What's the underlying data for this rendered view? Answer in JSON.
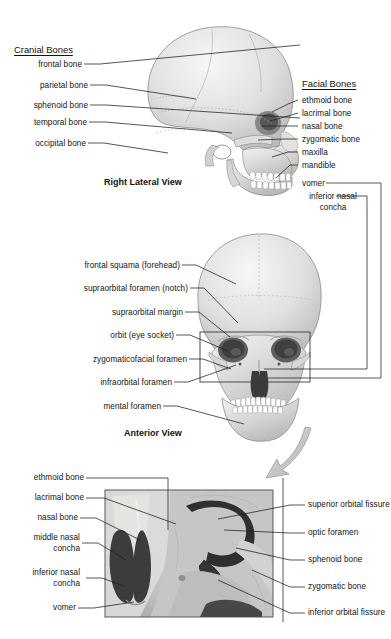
{
  "figure": {
    "background_color": "#ffffff",
    "line_color": "#1a1a1a",
    "panels": [
      {
        "name": "lateral",
        "caption": "Right Lateral View"
      },
      {
        "name": "anterior",
        "caption": "Anterior View"
      },
      {
        "name": "orbit-detail",
        "caption": ""
      }
    ]
  },
  "lateral_panel": {
    "caption": "Right Lateral View",
    "left_heading": "Cranial Bones",
    "right_heading": "Facial Bones",
    "cranial_bones": [
      {
        "label": "frontal bone"
      },
      {
        "label": "parietal bone"
      },
      {
        "label": "sphenoid bone"
      },
      {
        "label": "temporal bone"
      },
      {
        "label": "occipital bone"
      }
    ],
    "facial_bones": [
      {
        "label": "ethmoid bone"
      },
      {
        "label": "lacrimal bone"
      },
      {
        "label": "nasal bone"
      },
      {
        "label": "zygomatic bone"
      },
      {
        "label": "maxilla"
      },
      {
        "label": "mandible"
      },
      {
        "label": "vomer"
      },
      {
        "label": "inferior nasal concha"
      }
    ]
  },
  "anterior_panel": {
    "caption": "Anterior View",
    "labels": [
      {
        "label": "frontal squama (forehead)"
      },
      {
        "label": "supraorbital foramen (notch)"
      },
      {
        "label": "supraorbital margin"
      },
      {
        "label": "orbit (eye socket)"
      },
      {
        "label": "zygomaticofacial foramen"
      },
      {
        "label": "infraorbital foramen"
      },
      {
        "label": "mental foramen"
      }
    ]
  },
  "detail_panel": {
    "left_labels": [
      {
        "label": "ethmoid bone"
      },
      {
        "label": "lacrimal bone"
      },
      {
        "label": "nasal bone"
      },
      {
        "label": "middle nasal concha"
      },
      {
        "label": "inferior nasal concha"
      },
      {
        "label": "vomer"
      }
    ],
    "right_labels": [
      {
        "label": "superior orbital fissure"
      },
      {
        "label": "optic foramen"
      },
      {
        "label": "sphenoid bone"
      },
      {
        "label": "zygomatic bone"
      },
      {
        "label": "inferior orbital fissure"
      }
    ]
  }
}
